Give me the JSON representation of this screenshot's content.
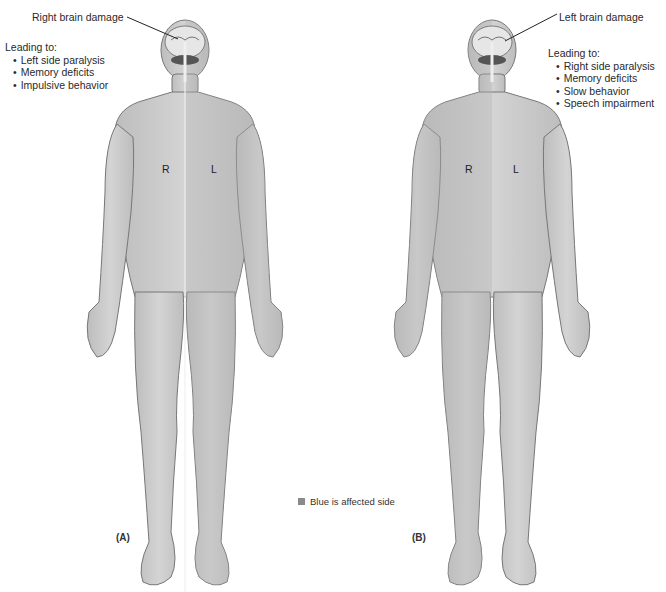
{
  "figure_a": {
    "panel_label": "(A)",
    "callout": "Right brain damage",
    "leading_title": "Leading to:",
    "effects": [
      "Left side paralysis",
      "Memory deficits",
      "Impulsive behavior"
    ],
    "side_labels": {
      "right": "R",
      "left": "L"
    },
    "affected_side": "left"
  },
  "figure_b": {
    "panel_label": "(B)",
    "callout": "Left brain damage",
    "leading_title": "Leading to:",
    "effects": [
      "Right side paralysis",
      "Memory deficits",
      "Slow behavior",
      "Speech impairment"
    ],
    "side_labels": {
      "right": "R",
      "left": "L"
    },
    "affected_side": "right"
  },
  "legend": {
    "label": "Blue is affected side",
    "swatch_color": "#8a8a8a"
  },
  "colors": {
    "skin_base": "#c9c9c9",
    "skin_affected": "#b8b8b8",
    "outline": "#6e6e6e",
    "midline": "#f2f2f2"
  }
}
